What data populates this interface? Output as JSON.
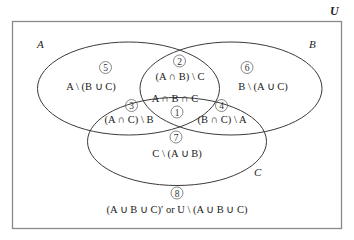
{
  "universe": {
    "label": "U"
  },
  "sets": [
    {
      "name": "A",
      "label": "A"
    },
    {
      "name": "B",
      "label": "B"
    },
    {
      "name": "C",
      "label": "C"
    }
  ],
  "regions": [
    {
      "number": "1",
      "expression": "A ∩ B ∩ C"
    },
    {
      "number": "2",
      "expression": "(A ∩ B) \\ C"
    },
    {
      "number": "3",
      "expression": "(A ∩ C) \\ B"
    },
    {
      "number": "4",
      "expression": "(B ∩ C) \\ A"
    },
    {
      "number": "5",
      "expression": "A \\ (B ∪ C)"
    },
    {
      "number": "6",
      "expression": "B \\ (A ∪ C)"
    },
    {
      "number": "7",
      "expression": "C \\ (A ∪ B)"
    },
    {
      "number": "8",
      "expression": "(A ∪  B ∪ C)′ or U \\ (A ∪  B ∪ C)"
    }
  ]
}
